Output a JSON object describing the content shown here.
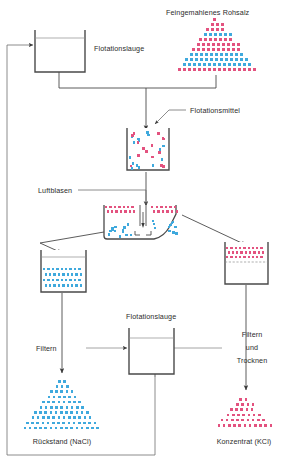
{
  "diagram": {
    "title_hidden": "",
    "labels": {
      "raw_salt": "Feingemahlenes Rohsalz",
      "flotation_liquor_top": "Flotationslauge",
      "flotation_agent": "Flotationsmittel",
      "air_bubbles": "Luftblasen",
      "flotation_liquor_bottom": "Flotationslauge",
      "filter_left": "Filtern",
      "filter_dry_right_line1": "Filtern",
      "filter_dry_right_line2": "und",
      "filter_dry_right_line3": "Trocknen",
      "residue": "Rückstand (NaCl)",
      "concentrate": "Konzentrat (KCl)"
    },
    "colors": {
      "nacl_blue": "#3fa9dd",
      "kcl_red": "#e3527f",
      "line": "#4a4a4a",
      "thin_line": "#8d8d8d",
      "text": "#2b2b2b"
    },
    "legend_meaning": {
      "blue_square": "NaCl",
      "red_square": "KCl"
    },
    "nodes": [
      {
        "id": "tank-flotation-liquor-top",
        "kind": "open-tank",
        "label": "Flotationslauge"
      },
      {
        "id": "heap-raw-salt",
        "kind": "triangle-heap",
        "label": "Feingemahlenes Rohsalz",
        "contents": "KCl+NaCl"
      },
      {
        "id": "tank-conditioner",
        "kind": "open-tank",
        "label": "Flotationsmittel",
        "contents": "KCl+NaCl"
      },
      {
        "id": "cell-flotation",
        "kind": "flotation-cell",
        "label": "Luftblasen",
        "contents": "froth KCl / pulp NaCl"
      },
      {
        "id": "tank-tailings",
        "kind": "open-tank",
        "contents": "NaCl"
      },
      {
        "id": "tank-froth",
        "kind": "open-tank",
        "contents": "KCl"
      },
      {
        "id": "tank-flotation-liquor-bottom",
        "kind": "open-tank",
        "label": "Flotationslauge"
      },
      {
        "id": "heap-residue",
        "kind": "triangle-heap",
        "label": "Rückstand (NaCl)",
        "contents": "NaCl"
      },
      {
        "id": "heap-concentrate",
        "kind": "triangle-heap",
        "label": "Konzentrat (KCl)",
        "contents": "KCl"
      }
    ]
  }
}
